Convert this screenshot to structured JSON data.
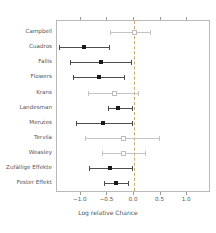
{
  "chart_data": {
    "type": "forest",
    "title": "",
    "xlabel": "Log relative Chance",
    "ylabel": "",
    "xlim": [
      -1.45,
      1.45
    ],
    "xticks": [
      -1.0,
      -0.5,
      0.0,
      0.5,
      1.0
    ],
    "xticklabels": [
      "−1.0",
      "−0.5",
      "0.0",
      "0.5",
      "1.0"
    ],
    "grid": false,
    "reference_line": 0.0,
    "legend": "none",
    "studies": [
      {
        "label": "Campbell",
        "estimate": 0.0,
        "ci_low": -0.46,
        "ci_high": 0.31,
        "significant": false
      },
      {
        "label": "Cuadros",
        "estimate": -0.94,
        "ci_low": -1.42,
        "ci_high": -0.47,
        "significant": true
      },
      {
        "label": "Fallis",
        "estimate": -0.62,
        "ci_low": -1.21,
        "ci_high": -0.06,
        "significant": true
      },
      {
        "label": "Flowers",
        "estimate": -0.65,
        "ci_low": -1.15,
        "ci_high": -0.18,
        "significant": true
      },
      {
        "label": "Krans",
        "estimate": -0.37,
        "ci_low": -0.86,
        "ci_high": 0.07,
        "significant": false
      },
      {
        "label": "Landesman",
        "estimate": -0.3,
        "ci_low": -0.49,
        "ci_high": -0.04,
        "significant": true
      },
      {
        "label": "Menzies",
        "estimate": -0.58,
        "ci_low": -1.1,
        "ci_high": -0.04,
        "significant": true
      },
      {
        "label": "Tervila",
        "estimate": -0.21,
        "ci_low": -0.93,
        "ci_high": 0.47,
        "significant": false
      },
      {
        "label": "Weasley",
        "estimate": -0.21,
        "ci_low": -0.6,
        "ci_high": 0.2,
        "significant": false
      },
      {
        "label": "Zufällige Effekte",
        "estimate": -0.45,
        "ci_low": -0.85,
        "ci_high": -0.04,
        "significant": true
      },
      {
        "label": "Fester Effekt",
        "estimate": -0.33,
        "ci_low": -0.57,
        "ci_high": -0.11,
        "significant": true
      }
    ]
  },
  "colors": {
    "point": "#1a1a1a",
    "faint_point": "#bdbdbd",
    "line": "#4d4d4d",
    "faint_line": "#c4c4c4",
    "reference": "#c9a96a",
    "frame": "#b9b9b9",
    "text": "#555555"
  }
}
